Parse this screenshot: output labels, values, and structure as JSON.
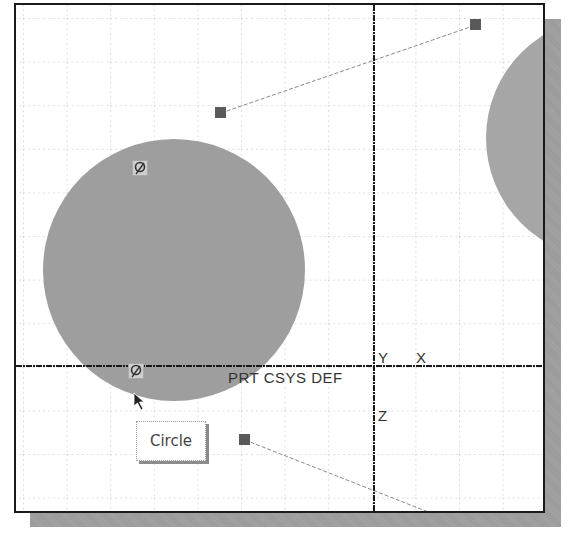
{
  "canvas": {
    "background": "#ffffff",
    "frame_color": "#1a1a1a",
    "shadow_color": "#a3a3a3",
    "grid_color": "#c4c4c4",
    "grid_spacing_px": 43.6,
    "fill_color": "#9e9e9e"
  },
  "coordinate_system": {
    "label": "PRT_CSYS_DEF",
    "display_label": "PRT CSYS DEF",
    "axis_y": "Y",
    "axis_x": "X",
    "axis_z": "Z"
  },
  "entities": {
    "circle_main": {
      "type": "circle",
      "cx": 158,
      "cy": 265,
      "r": 131
    },
    "circle_right": {
      "type": "circle",
      "cx": 591,
      "cy": 133,
      "r": 121
    },
    "centerline_top": {
      "type": "construction-line",
      "x1": 205,
      "y1": 108,
      "x2": 460,
      "y2": 20
    },
    "centerline_bottom": {
      "type": "construction-line",
      "x1": 229,
      "y1": 435,
      "x2": 420,
      "y2": 510
    }
  },
  "tooltip": {
    "text": "Circle"
  },
  "icons": {
    "snap_top": "tangent-snap-icon",
    "snap_bottom": "tangent-snap-icon",
    "cursor": "arrow-cursor-icon"
  }
}
